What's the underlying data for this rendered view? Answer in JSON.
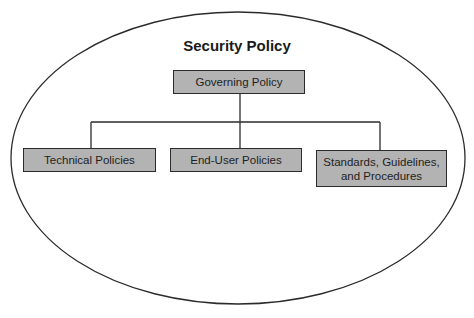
{
  "diagram": {
    "title": "Security Policy",
    "root": {
      "label": "Governing Policy"
    },
    "children": [
      {
        "label": "Technical Policies"
      },
      {
        "label": "End-User Policies"
      },
      {
        "label": "Standards, Guidelines,",
        "label2": "and Procedures"
      }
    ]
  },
  "colors": {
    "box_fill": "#b3b3b3",
    "stroke": "#2b2b2b",
    "background": "#ffffff"
  }
}
